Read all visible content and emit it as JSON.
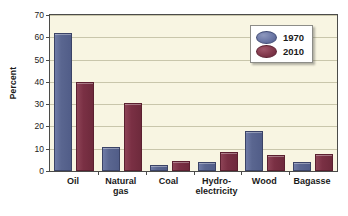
{
  "chart_data": {
    "type": "bar",
    "title": "",
    "xlabel": "",
    "ylabel": "Percent",
    "ylim": [
      0,
      70
    ],
    "yticks": [
      0,
      10,
      20,
      30,
      40,
      50,
      60,
      70
    ],
    "grid": true,
    "legend_position": "top-right",
    "categories": [
      "Oil",
      "Natural\ngas",
      "Coal",
      "Hydro-\nelectricity",
      "Wood",
      "Bagasse"
    ],
    "series": [
      {
        "name": "1970",
        "color": "#5a6690",
        "values": [
          62,
          11,
          2.5,
          4.1,
          18,
          4
        ]
      },
      {
        "name": "2010",
        "color": "#7a3044",
        "values": [
          40,
          30.5,
          4.3,
          8.4,
          7.2,
          7.5
        ]
      }
    ]
  },
  "axis": {
    "y_title": "Percent",
    "y_tick_labels": [
      "0",
      "10",
      "20",
      "30",
      "40",
      "50",
      "60",
      "70"
    ],
    "x_tick_labels": [
      "Oil",
      "Natural\ngas",
      "Coal",
      "Hydro-\nelectricity",
      "Wood",
      "Bagasse"
    ]
  },
  "legend": {
    "entries": [
      {
        "label": "1970",
        "swatch": "blue-ellipse-swatch"
      },
      {
        "label": "2010",
        "swatch": "red-ellipse-swatch"
      }
    ]
  },
  "colors": {
    "series_1970": "#5a6690",
    "series_2010": "#7a3044",
    "plot_background": "#f8f5e2",
    "gridline": "#c9c6ab",
    "axis_line": "#4b4b49",
    "page_background": "#ffffff"
  }
}
